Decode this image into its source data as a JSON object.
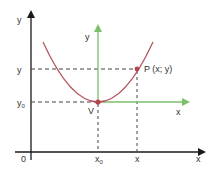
{
  "diagram": {
    "colors": {
      "main_axes": "#1a1a1a",
      "translated_axes": "#7cbf6a",
      "curve": "#b5555f",
      "points": "#b5454f",
      "dashes": "#444444"
    },
    "labels": {
      "origin": "0",
      "main_x_axis": "x",
      "main_y_axis": "y",
      "translated_x_axis": "x",
      "translated_y_axis": "y",
      "y_tick": "y",
      "y0_tick_base": "y",
      "y0_tick_sub": "0",
      "x0_tick_base": "x",
      "x0_tick_sub": "0",
      "x_tick": "x",
      "vertex": "V",
      "point": "P (x; y)"
    }
  }
}
